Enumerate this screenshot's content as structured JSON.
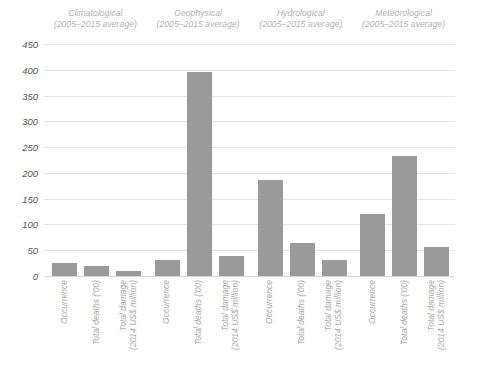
{
  "chart_data": {
    "type": "bar",
    "title": "",
    "subtitle": "",
    "xlabel": "",
    "ylabel": "",
    "ylim": [
      0,
      450
    ],
    "ytick_step": 50,
    "yticks": [
      "450",
      "400",
      "350",
      "300",
      "250",
      "200",
      "150",
      "100",
      "50",
      "0"
    ],
    "grid": true,
    "legend": "none",
    "bar_color": "#9a9a9a",
    "gridline_color": "#e3e3e3",
    "categories": [
      "Occurrence",
      "Total deaths ('00)",
      "Total damage (2014 US$ million)"
    ],
    "category_labels": [
      {
        "line1": "Occurrence",
        "line2": ""
      },
      {
        "line1": "Total deaths ('00)",
        "line2": ""
      },
      {
        "line1": "Total damage",
        "line2": "(2014 US$ million)"
      }
    ],
    "groups": [
      {
        "name": "Climatological",
        "subtitle": "(2005–2015 average)",
        "values": [
          25,
          20,
          9
        ]
      },
      {
        "name": "Geophysical",
        "subtitle": "(2005–2015 average)",
        "values": [
          31,
          395,
          39
        ]
      },
      {
        "name": "Hydrological",
        "subtitle": "(2005–2015 average)",
        "values": [
          186,
          65,
          31
        ]
      },
      {
        "name": "Meteorological",
        "subtitle": "(2005–2015 average)",
        "values": [
          120,
          233,
          56
        ]
      }
    ]
  }
}
